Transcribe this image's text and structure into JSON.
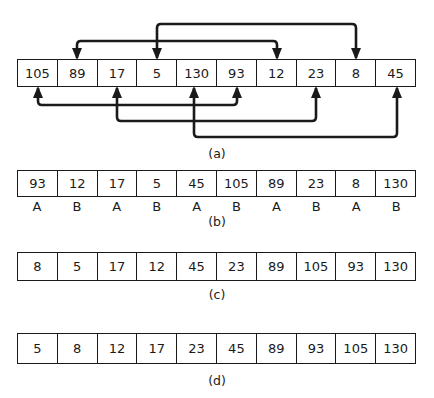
{
  "figure": {
    "row_a": {
      "label": "(a)",
      "values": [
        "105",
        "89",
        "17",
        "5",
        "130",
        "93",
        "12",
        "23",
        "8",
        "45"
      ],
      "swaps_above": [
        {
          "from": "5",
          "to": "8"
        },
        {
          "from": "89",
          "to": "12"
        }
      ],
      "swaps_below": [
        {
          "from": "105",
          "to": "93"
        },
        {
          "from": "17",
          "to": "23"
        },
        {
          "from": "130",
          "to": "45"
        }
      ]
    },
    "row_b": {
      "label": "(b)",
      "values": [
        "93",
        "12",
        "17",
        "5",
        "45",
        "105",
        "89",
        "23",
        "8",
        "130"
      ],
      "tags": [
        "A",
        "B",
        "A",
        "B",
        "A",
        "B",
        "A",
        "B",
        "A",
        "B"
      ]
    },
    "row_c": {
      "label": "(c)",
      "values": [
        "8",
        "5",
        "17",
        "12",
        "45",
        "23",
        "89",
        "105",
        "93",
        "130"
      ]
    },
    "row_d": {
      "label": "(d)",
      "values": [
        "5",
        "8",
        "12",
        "17",
        "23",
        "45",
        "89",
        "93",
        "105",
        "130"
      ]
    }
  },
  "colors": {
    "stroke": "#1a1a1a",
    "background": "#ffffff"
  }
}
